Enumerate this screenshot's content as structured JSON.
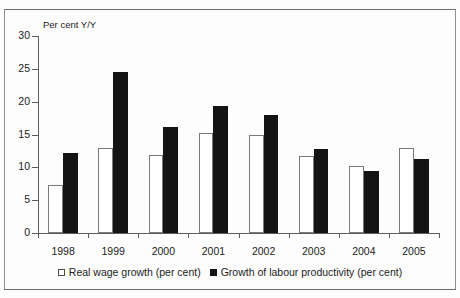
{
  "figure": {
    "clipped_caption": "",
    "y_axis_title": "Per cent Y/Y"
  },
  "legend": {
    "items": [
      {
        "label": "Real wage growth (per cent)",
        "marker": "open-square-icon",
        "color": "#ffffff"
      },
      {
        "label": "Growth of labour productivity (per cent)",
        "marker": "filled-square-icon",
        "color": "#141414"
      }
    ]
  },
  "chart_data": {
    "type": "bar",
    "title": "",
    "subtitle": "",
    "xlabel": "",
    "ylabel": "Per cent Y/Y",
    "ylim": [
      0,
      30
    ],
    "yticks": [
      0,
      5,
      10,
      15,
      20,
      25,
      30
    ],
    "ytick_labels": [
      "0",
      "5",
      "10",
      "15",
      "20",
      "25",
      "30"
    ],
    "grid": false,
    "legend_position": "bottom",
    "categories": [
      "1998",
      "1999",
      "2000",
      "2001",
      "2002",
      "2003",
      "2004",
      "2005"
    ],
    "series": [
      {
        "name": "Real wage growth (per cent)",
        "style": "open",
        "color": "#ffffff",
        "edge_color": "#7a7a7a",
        "values": [
          7.3,
          13.0,
          11.9,
          15.2,
          14.9,
          11.7,
          10.2,
          12.9
        ]
      },
      {
        "name": "Growth of labour productivity (per cent)",
        "style": "filled",
        "color": "#141414",
        "edge_color": "#141414",
        "values": [
          12.2,
          24.5,
          16.2,
          19.4,
          18.0,
          12.8,
          9.5,
          11.3
        ]
      }
    ]
  }
}
